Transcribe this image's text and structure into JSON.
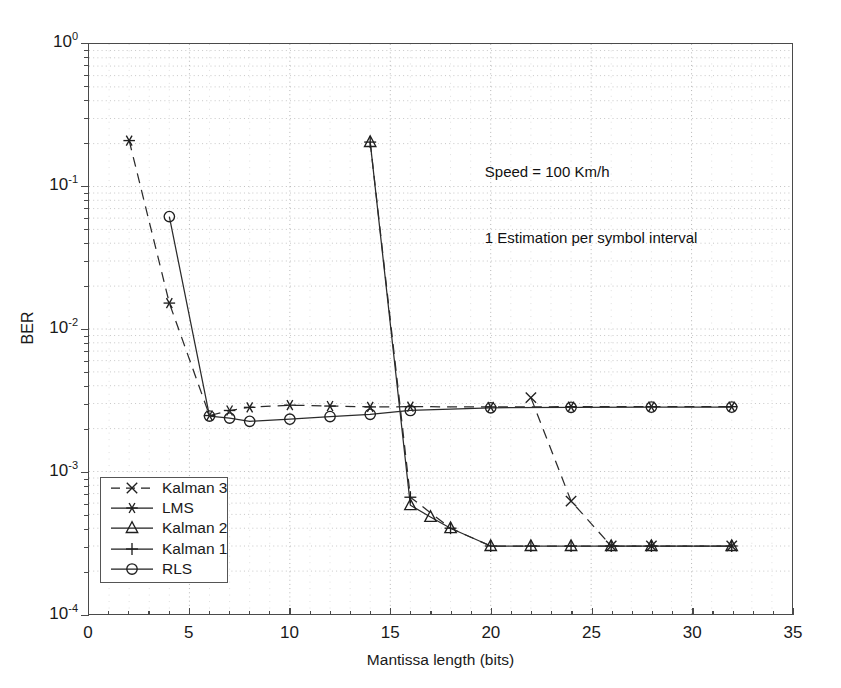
{
  "chart_data": {
    "type": "line",
    "title": "",
    "xlabel": "Mantissa length (bits)",
    "ylabel": "BER",
    "xlim": [
      0,
      35
    ],
    "ylim": [
      0.0001,
      1
    ],
    "yscale": "log",
    "xscale": "linear",
    "xticks": [
      0,
      5,
      10,
      15,
      20,
      25,
      30,
      35
    ],
    "xticklabels": [
      "0",
      "5",
      "10",
      "15",
      "20",
      "25",
      "30",
      "35"
    ],
    "yticks": [
      1,
      0.1,
      0.01,
      0.001,
      0.0001
    ],
    "yticklabels": [
      "10^0",
      "10^-1",
      "10^-2",
      "10^-3",
      "10^-4"
    ],
    "grid": true,
    "grid_style": "dotted-minor",
    "legend_position": "lower left",
    "annotations": [
      "Speed = 100 Km/h",
      "1 Estimation per symbol interval"
    ],
    "series": [
      {
        "name": "Kalman 3",
        "marker": "x",
        "linestyle": "dashed",
        "color": "#262626",
        "x": [
          22,
          24,
          26,
          28,
          32
        ],
        "y": [
          0.0033,
          0.00062,
          0.0003,
          0.0003,
          0.0003
        ]
      },
      {
        "name": "LMS",
        "marker": "asterisk",
        "linestyle": "dashed",
        "color": "#262626",
        "x": [
          2,
          4,
          6,
          7,
          8,
          10,
          12,
          14,
          16,
          20,
          24,
          28,
          32
        ],
        "y": [
          0.21,
          0.0152,
          0.00247,
          0.00268,
          0.00282,
          0.00292,
          0.00288,
          0.00284,
          0.00285,
          0.00284,
          0.00285,
          0.00285,
          0.00285
        ]
      },
      {
        "name": "Kalman 2",
        "marker": "triangle",
        "linestyle": "solid",
        "color": "#262626",
        "x": [
          14,
          16,
          17,
          18,
          20,
          22,
          24,
          26,
          28,
          32
        ],
        "y": [
          0.205,
          0.00058,
          0.00048,
          0.0004,
          0.0003,
          0.0003,
          0.0003,
          0.0003,
          0.0003,
          0.0003
        ]
      },
      {
        "name": "Kalman 1",
        "marker": "plus",
        "linestyle": "dashed",
        "color": "#262626",
        "x": [
          14,
          16,
          18,
          20,
          22,
          24,
          26,
          28,
          32
        ],
        "y": [
          0.205,
          0.00066,
          0.0004,
          0.0003,
          0.0003,
          0.0003,
          0.0003,
          0.0003,
          0.0003
        ]
      },
      {
        "name": "RLS",
        "marker": "circle",
        "linestyle": "solid",
        "color": "#262626",
        "x": [
          4,
          6,
          7,
          8,
          10,
          12,
          14,
          16,
          20,
          24,
          28,
          32
        ],
        "y": [
          0.0615,
          0.00245,
          0.00237,
          0.00225,
          0.00233,
          0.00243,
          0.00252,
          0.00268,
          0.0028,
          0.00282,
          0.00283,
          0.00283
        ]
      }
    ]
  },
  "legend": {
    "items": [
      {
        "label": "Kalman 3",
        "marker": "x",
        "linestyle": "dashed"
      },
      {
        "label": "LMS",
        "marker": "asterisk",
        "linestyle": "solid"
      },
      {
        "label": "Kalman 2",
        "marker": "triangle",
        "linestyle": "solid"
      },
      {
        "label": "Kalman 1",
        "marker": "plus",
        "linestyle": "solid"
      },
      {
        "label": "RLS",
        "marker": "circle",
        "linestyle": "solid"
      }
    ]
  },
  "axes": {
    "x_title": "Mantissa length (bits)",
    "y_title": "BER"
  },
  "annotation_lines": {
    "line1": "Speed = 100 Km/h",
    "line2": "1 Estimation per symbol interval"
  }
}
